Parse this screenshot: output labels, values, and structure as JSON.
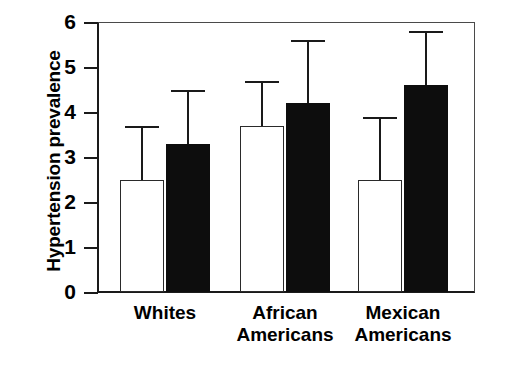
{
  "chart_data": {
    "type": "bar",
    "title": "",
    "xlabel": "",
    "ylabel": "Hypertension prevalence",
    "categories": [
      "Whites",
      "African\nAmericans",
      "Mexican\nAmericans"
    ],
    "category_labels_flat": [
      "Whites",
      "African Americans",
      "Mexican Americans"
    ],
    "ylim": [
      0,
      6
    ],
    "ytick_labels": [
      "0",
      "1",
      "2",
      "3",
      "4",
      "5",
      "6"
    ],
    "ytick_values": [
      0,
      1,
      2,
      3,
      4,
      5,
      6
    ],
    "grid": false,
    "legend": "none",
    "series": [
      {
        "name": "open-bar",
        "fill": "#ffffff",
        "edge": "#000000",
        "values": [
          2.5,
          3.7,
          2.5
        ],
        "error_upper": [
          3.7,
          4.7,
          3.9
        ]
      },
      {
        "name": "filled-bar",
        "fill": "#000000",
        "edge": "#000000",
        "values": [
          3.3,
          4.2,
          4.6
        ],
        "error_upper": [
          4.5,
          5.6,
          5.8
        ]
      }
    ]
  },
  "colors": {
    "axis": "#1a1a1a",
    "frame": "#4a4a4a",
    "open_bar_fill": "#ffffff",
    "filled_bar_fill": "#0d0d0d",
    "background": "#ffffff"
  }
}
